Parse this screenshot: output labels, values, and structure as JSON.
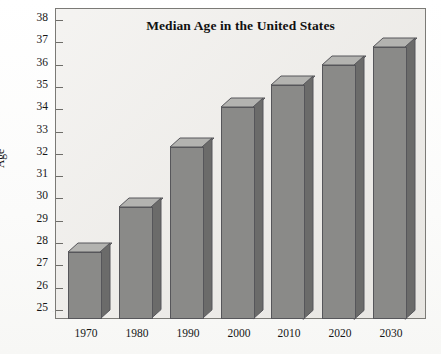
{
  "chart_data": {
    "type": "bar",
    "title": "Median Age in the United States",
    "xlabel": "",
    "ylabel": "Age",
    "categories": [
      "1970",
      "1980",
      "1990",
      "2000",
      "2010",
      "2020",
      "2030"
    ],
    "values": [
      27.6,
      29.6,
      32.3,
      34.1,
      35.1,
      36.0,
      36.8
    ],
    "ylim": [
      24.6,
      38.4
    ],
    "yticks": [
      25,
      26,
      27,
      28,
      29,
      30,
      31,
      32,
      33,
      34,
      35,
      36,
      37,
      38
    ],
    "ytick_labels": [
      "25",
      "26",
      "27",
      "28",
      "29",
      "30",
      "31",
      "32",
      "33",
      "34",
      "35",
      "36",
      "37",
      "38"
    ],
    "grid": false,
    "legend": false,
    "style": "3d-bar",
    "colors": {
      "bar_front": "#8a8a88",
      "bar_top": "#b3b3b0",
      "bar_side": "#6b6b6a",
      "bar_edge": "#56565a",
      "plot_background": "#eceae6",
      "plot_border": "#7b7a76",
      "page_background": "#fdfdfc",
      "text": "#161616"
    }
  }
}
